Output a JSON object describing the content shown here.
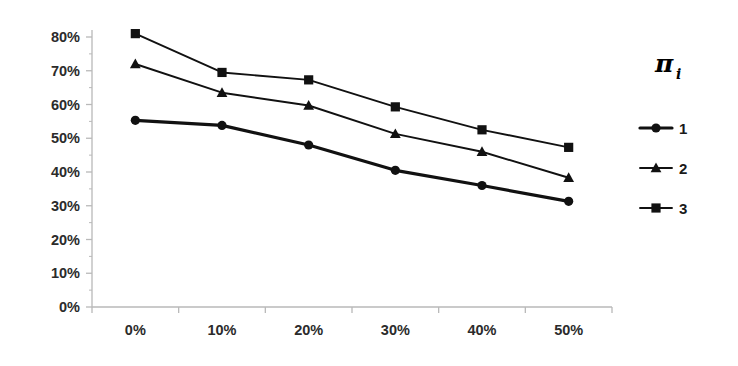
{
  "chart_data": {
    "type": "line",
    "title": "",
    "subtitle": "",
    "xlabel": "",
    "ylabel": "",
    "categories": [
      "0%",
      "10%",
      "20%",
      "30%",
      "40%",
      "50%"
    ],
    "x_tick_labels": [
      "0%",
      "10%",
      "20%",
      "30%",
      "40%",
      "50%"
    ],
    "y_tick_labels": [
      "0%",
      "10%",
      "20%",
      "30%",
      "40%",
      "50%",
      "60%",
      "70%",
      "80%"
    ],
    "y_tick_values": [
      0,
      10,
      20,
      30,
      40,
      50,
      60,
      70,
      80
    ],
    "ylim": [
      0,
      80
    ],
    "grid": false,
    "legend_position": "right",
    "legend_title": "π",
    "legend_title_subscript": "i",
    "series": [
      {
        "name": "1",
        "marker": "circle",
        "line_width": 3.2,
        "color": "#111111",
        "values": [
          55.3,
          53.8,
          48.0,
          40.5,
          36.0,
          31.3
        ]
      },
      {
        "name": "2",
        "marker": "triangle",
        "line_width": 1.9,
        "color": "#111111",
        "values": [
          72.0,
          63.5,
          59.7,
          51.3,
          46.0,
          38.3
        ]
      },
      {
        "name": "3",
        "marker": "square",
        "line_width": 1.9,
        "color": "#111111",
        "values": [
          81.0,
          69.5,
          67.3,
          59.3,
          52.5,
          47.3
        ]
      }
    ]
  },
  "axes": {
    "axis_color": "#b9b9b9",
    "tick_color": "#b9b9b9"
  },
  "legend": {
    "entries": [
      {
        "label": "1",
        "marker": "circle"
      },
      {
        "label": "2",
        "marker": "triangle"
      },
      {
        "label": "3",
        "marker": "square"
      }
    ]
  }
}
